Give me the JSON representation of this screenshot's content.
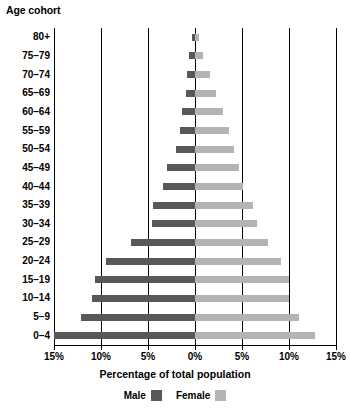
{
  "chart_data": {
    "type": "bar",
    "title": "",
    "subtype": "population-pyramid",
    "ylabel": "Age cohort",
    "xlabel": "Percentage of total population",
    "categories": [
      "80+",
      "75–79",
      "70–74",
      "65–69",
      "60–64",
      "55–59",
      "50–54",
      "45–49",
      "40–44",
      "35–39",
      "30–34",
      "25–29",
      "20–24",
      "15–19",
      "10–14",
      "5–9",
      "0–4"
    ],
    "series": [
      {
        "name": "Male",
        "color": "#585858",
        "values": [
          0.3,
          0.6,
          0.8,
          1.0,
          1.4,
          1.6,
          2.0,
          3.0,
          3.4,
          4.5,
          4.6,
          6.8,
          9.5,
          10.6,
          11.0,
          12.1,
          15.0
        ]
      },
      {
        "name": "Female",
        "color": "#b4b4b4",
        "values": [
          0.4,
          0.9,
          1.6,
          2.2,
          3.0,
          3.6,
          4.2,
          4.7,
          5.1,
          6.2,
          6.6,
          7.8,
          9.2,
          10.0,
          10.0,
          11.1,
          12.8
        ]
      }
    ],
    "xlim": [
      -15,
      15
    ],
    "xticks": [
      -15,
      -10,
      -5,
      0,
      5,
      10,
      15
    ],
    "xticklabels": [
      "15%",
      "10%",
      "5%",
      "0%",
      "5%",
      "10%",
      "15%"
    ],
    "gridlines": [
      -15,
      -10,
      -5,
      0,
      5,
      10,
      15
    ],
    "grid": true,
    "legend_position": "bottom",
    "legend": [
      "Male",
      "Female"
    ]
  },
  "axis": {
    "y_title": "Age cohort",
    "x_title": "Percentage of total population"
  },
  "legend": {
    "male_label": "Male",
    "female_label": "Female",
    "male_color": "#585858",
    "female_color": "#b4b4b4"
  }
}
